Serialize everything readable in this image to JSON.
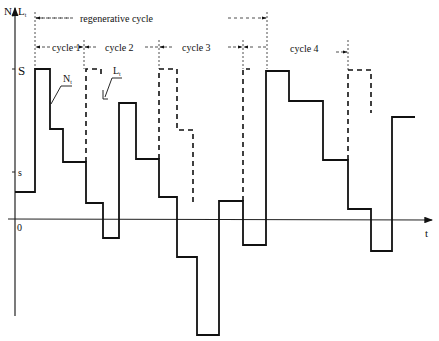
{
  "diagram": {
    "y_axis_label_n": "N",
    "y_axis_label_n_sub": "t",
    "y_axis_label_l": "L",
    "y_axis_label_l_sub": "t",
    "x_axis_label": "t",
    "tick_upper": "S",
    "tick_lower": "s",
    "origin_label": "0",
    "regenerative_label": "regenerative cycle",
    "cycles": [
      {
        "label": "cycle 1"
      },
      {
        "label": "cycle 2"
      },
      {
        "label": "cycle 3"
      },
      {
        "label": "cycle 4"
      }
    ],
    "curve_n_label": "N",
    "curve_n_sub": "t",
    "curve_l_label": "L",
    "curve_l_sub": "t",
    "colors": {
      "line": "#111111",
      "background": "#ffffff"
    }
  }
}
